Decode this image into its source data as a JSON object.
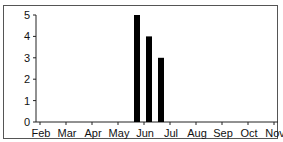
{
  "chart_data": {
    "type": "bar",
    "title": "",
    "xlabel": "",
    "ylabel": "",
    "ylim": [
      0,
      5
    ],
    "yticks": [
      0,
      1,
      2,
      3,
      4,
      5
    ],
    "xticks": [
      "Feb",
      "Mar",
      "Apr",
      "May",
      "Jun",
      "Jul",
      "Aug",
      "Sep",
      "Oct",
      "Nov"
    ],
    "grid": false,
    "legend": null,
    "bars": [
      {
        "position": "Jun",
        "value": 5
      },
      {
        "position": "late Jun",
        "value": 4
      },
      {
        "position": "Jul",
        "value": 3
      }
    ],
    "bar_color": "#000000"
  }
}
